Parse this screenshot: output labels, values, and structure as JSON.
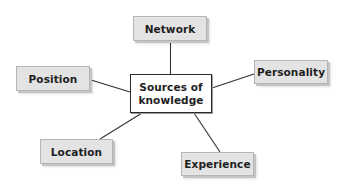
{
  "diagram": {
    "type": "mind-map",
    "center": {
      "label_line1": "Sources of",
      "label_line2": "knowledge"
    },
    "nodes": [
      {
        "id": "network",
        "label": "Network"
      },
      {
        "id": "personality",
        "label": "Personality"
      },
      {
        "id": "position",
        "label": "Position"
      },
      {
        "id": "location",
        "label": "Location"
      },
      {
        "id": "experience",
        "label": "Experience"
      }
    ],
    "edges": [
      {
        "from": "center",
        "to": "network"
      },
      {
        "from": "center",
        "to": "personality"
      },
      {
        "from": "center",
        "to": "position"
      },
      {
        "from": "center",
        "to": "location"
      },
      {
        "from": "center",
        "to": "experience"
      }
    ],
    "colors": {
      "node_fill": "#e3e3e3",
      "node_border": "#b5b5b5",
      "center_fill": "#ffffff",
      "center_border": "#2a2a2a",
      "connector": "#333333",
      "text": "#1e1e1e"
    }
  }
}
